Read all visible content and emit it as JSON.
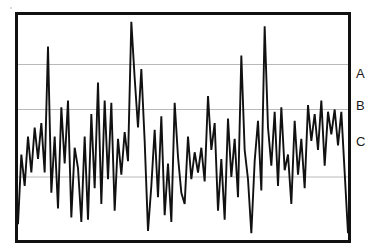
{
  "figure": {
    "title": "",
    "background_color": "#ffffff",
    "frame_color": "#111111",
    "gridline_color": "#b9b9b9",
    "series_color": "#111111"
  },
  "labels": {
    "a": "A",
    "b": "B",
    "c": "C"
  },
  "chart_data": {
    "type": "line",
    "title": "",
    "xlabel": "",
    "ylabel": "",
    "grid": true,
    "legend_position": "right-outside",
    "xlim": [
      0,
      99
    ],
    "ylim": [
      0,
      100
    ],
    "yticks": [
      28,
      58,
      78
    ],
    "ytick_labels": [
      "C",
      "B",
      "A"
    ],
    "gridlines": [
      {
        "label": "A",
        "value": 78
      },
      {
        "label": "B",
        "value": 58
      },
      {
        "label": "C",
        "value": 28
      }
    ],
    "series": [
      {
        "name": "signal",
        "color": "#111111",
        "x": [
          0,
          1,
          2,
          3,
          4,
          5,
          6,
          7,
          8,
          9,
          10,
          11,
          12,
          13,
          14,
          15,
          16,
          17,
          18,
          19,
          20,
          21,
          22,
          23,
          24,
          25,
          26,
          27,
          28,
          29,
          30,
          31,
          32,
          33,
          34,
          35,
          36,
          37,
          38,
          39,
          40,
          41,
          42,
          43,
          44,
          45,
          46,
          47,
          48,
          49,
          50,
          51,
          52,
          53,
          54,
          55,
          56,
          57,
          58,
          59,
          60,
          61,
          62,
          63,
          64,
          65,
          66,
          67,
          68,
          69,
          70,
          71,
          72,
          73,
          74,
          75,
          76,
          77,
          78,
          79,
          80,
          81,
          82,
          83,
          84,
          85,
          86,
          87,
          88,
          89,
          90,
          91,
          92,
          93,
          94,
          95,
          96,
          97,
          98,
          99
        ],
        "values": [
          7,
          38,
          24,
          46,
          30,
          50,
          36,
          52,
          30,
          86,
          21,
          46,
          14,
          59,
          34,
          62,
          10,
          41,
          32,
          8,
          46,
          9,
          56,
          23,
          70,
          16,
          62,
          27,
          61,
          13,
          45,
          29,
          48,
          35,
          97,
          72,
          50,
          76,
          44,
          4,
          24,
          49,
          19,
          55,
          11,
          34,
          8,
          61,
          37,
          21,
          16,
          46,
          27,
          39,
          30,
          41,
          26,
          64,
          40,
          52,
          13,
          36,
          9,
          54,
          28,
          45,
          19,
          82,
          40,
          27,
          3,
          35,
          53,
          22,
          95,
          50,
          33,
          57,
          24,
          59,
          31,
          38,
          16,
          53,
          29,
          45,
          23,
          60,
          44,
          56,
          40,
          62,
          33,
          57,
          47,
          58,
          42,
          57,
          30,
          3
        ]
      }
    ]
  }
}
